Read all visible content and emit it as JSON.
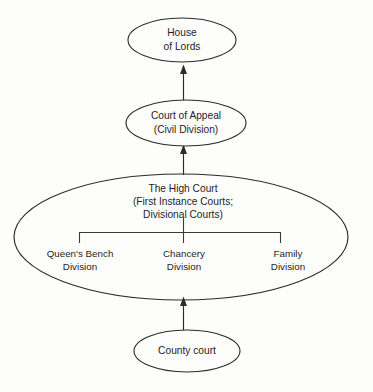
{
  "diagram": {
    "background_color": "#fdfdfc",
    "line_color": "#2b2b2b",
    "text_color": "#1d1d1d",
    "nodes": {
      "house_of_lords": {
        "line1": "House",
        "line2": "of Lords"
      },
      "court_of_appeal": {
        "line1": "Court of Appeal",
        "line2": "(Civil Division)"
      },
      "high_court": {
        "line1": "The High Court",
        "line2": "(First Instance Courts;",
        "line3": "Divisional Courts)"
      },
      "county_court": {
        "line1": "County court"
      }
    },
    "divisions": [
      {
        "line1": "Queen's Bench",
        "line2": "Division"
      },
      {
        "line1": "Chancery",
        "line2": "Division"
      },
      {
        "line1": "Family",
        "line2": "Division"
      }
    ],
    "arrows": [
      {
        "from": "court_of_appeal",
        "to": "house_of_lords"
      },
      {
        "from": "high_court",
        "to": "court_of_appeal"
      },
      {
        "from": "county_court",
        "to": "high_court"
      }
    ]
  }
}
